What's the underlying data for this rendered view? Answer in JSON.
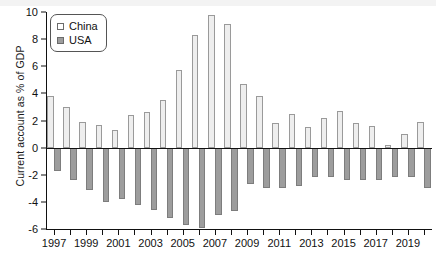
{
  "chart_data": {
    "type": "bar",
    "title": "",
    "subtitle": "",
    "xlabel": "",
    "ylabel": "Current account as % of GDP",
    "ylim": [
      -6,
      10
    ],
    "yticks": [
      10,
      8,
      6,
      4,
      2,
      0,
      -2,
      -4,
      -6
    ],
    "ytick_labels": [
      "10",
      "8",
      "6",
      "4",
      "2",
      "0",
      "-2",
      "-4",
      "-6"
    ],
    "grid": false,
    "legend_position": "top-left",
    "categories": [
      "1997",
      "1998",
      "1999",
      "2000",
      "2001",
      "2002",
      "2003",
      "2004",
      "2005",
      "2006",
      "2007",
      "2008",
      "2009",
      "2010",
      "2011",
      "2012",
      "2013",
      "2014",
      "2015",
      "2016",
      "2017",
      "2018",
      "2019",
      "2020"
    ],
    "xtick_labels": [
      "1997",
      "1999",
      "2001",
      "2003",
      "2005",
      "2007",
      "2009",
      "2011",
      "2013",
      "2015",
      "2017",
      "2019"
    ],
    "series": [
      {
        "name": "China",
        "color": "#eeeeee",
        "edge_color": "#9a9a9a",
        "values": [
          3.8,
          3.0,
          1.9,
          1.7,
          1.3,
          2.4,
          2.6,
          3.5,
          5.7,
          8.3,
          9.8,
          9.1,
          4.7,
          3.8,
          1.8,
          2.5,
          1.5,
          2.2,
          2.7,
          1.8,
          1.6,
          0.2,
          1.0,
          1.9
        ],
        "units": "% of GDP"
      },
      {
        "name": "USA",
        "color": "#9d9d9d",
        "edge_color": "#7d7d7d",
        "values": [
          -1.7,
          -2.4,
          -3.1,
          -4.0,
          -3.8,
          -4.2,
          -4.6,
          -5.2,
          -5.7,
          -5.9,
          -5.0,
          -4.7,
          -2.7,
          -3.0,
          -3.0,
          -2.8,
          -2.2,
          -2.2,
          -2.4,
          -2.4,
          -2.4,
          -2.2,
          -2.2,
          -3.0
        ],
        "units": "% of GDP"
      }
    ]
  },
  "legend": {
    "items": [
      {
        "label": "China",
        "swatch": "china-swatch"
      },
      {
        "label": "USA",
        "swatch": "usa-swatch"
      }
    ]
  }
}
